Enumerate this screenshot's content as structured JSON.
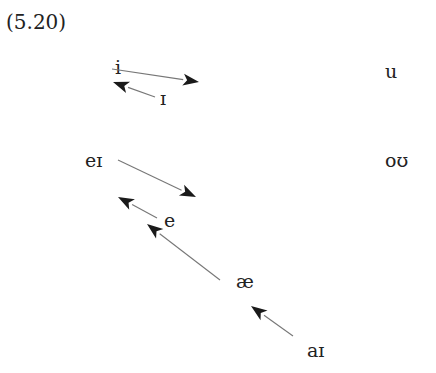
{
  "example_number": "(5.20)",
  "vowels": {
    "i": {
      "label": "i",
      "x": 115,
      "y": 58
    },
    "ih": {
      "label": "ɪ",
      "x": 160,
      "y": 89
    },
    "u": {
      "label": "u",
      "x": 385,
      "y": 62
    },
    "ei": {
      "label": "eɪ",
      "x": 85,
      "y": 151
    },
    "ou": {
      "label": "oʊ",
      "x": 385,
      "y": 151
    },
    "e": {
      "label": "e",
      "x": 164,
      "y": 211
    },
    "ae": {
      "label": "æ",
      "x": 236,
      "y": 272
    },
    "ai": {
      "label": "aɪ",
      "x": 307,
      "y": 341
    }
  },
  "arrows": [
    {
      "from": "i",
      "to": "right",
      "x1": 112,
      "y1": 69,
      "x2": 199,
      "y2": 82
    },
    {
      "from": "ɪ",
      "to": "i",
      "x1": 155,
      "y1": 97,
      "x2": 113,
      "y2": 82
    },
    {
      "from": "eɪ",
      "to": "right-down",
      "x1": 118,
      "y1": 160,
      "x2": 196,
      "y2": 197
    },
    {
      "from": "e",
      "to": "eɪ",
      "x1": 157,
      "y1": 218,
      "x2": 118,
      "y2": 197
    },
    {
      "from": "æ",
      "to": "e",
      "x1": 220,
      "y1": 280,
      "x2": 147,
      "y2": 224
    },
    {
      "from": "aɪ",
      "to": "æ",
      "x1": 293,
      "y1": 336,
      "x2": 251,
      "y2": 306
    }
  ],
  "colors": {
    "line": "#777777",
    "arrowhead": "#1a1a1a",
    "text": "#222222"
  }
}
